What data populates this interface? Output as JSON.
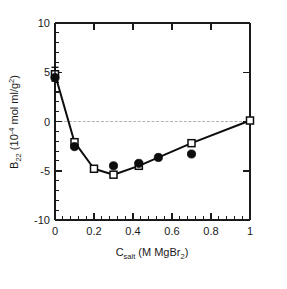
{
  "chart_data": {
    "type": "line",
    "title": "",
    "subtitle": "",
    "xlabel_parts": {
      "main_c": "C",
      "sub_salt": "salt",
      "units": " (M MgBr",
      "sub_2": "2",
      "close": ")"
    },
    "xlabel": "Csalt (M MgBr2)",
    "ylabel_parts": {
      "main_b": "B",
      "sub_22": "22",
      "open": " (10",
      "sup_minus4": "-4",
      "units": " mol ml/g",
      "sup_2": "2",
      "close": ")"
    },
    "ylabel": "B22 (10-4 mol ml/g2)",
    "xlim": [
      0,
      1
    ],
    "ylim": [
      -10,
      10
    ],
    "xticks": [
      0,
      0.2,
      0.4,
      0.6,
      0.8,
      1
    ],
    "xtick_labels": [
      "0",
      "0.2",
      "0.4",
      "0.6",
      "0.8",
      "1"
    ],
    "yticks": [
      -10,
      -5,
      0,
      5,
      10
    ],
    "ytick_labels": [
      "-10",
      "-5",
      "0",
      "5",
      "10"
    ],
    "x_minor_count": 4,
    "y_minor_count": 4,
    "grid": false,
    "zero_line": true,
    "legend_position": "none",
    "series": [
      {
        "name": "open-squares-with-line",
        "marker": "open-square",
        "connected": true,
        "points": [
          {
            "x": 0.0,
            "y": 4.8,
            "yerr": 0.7
          },
          {
            "x": 0.1,
            "y": -2.1,
            "yerr": 0
          },
          {
            "x": 0.2,
            "y": -4.8,
            "yerr": 0
          },
          {
            "x": 0.3,
            "y": -5.4,
            "yerr": 0
          },
          {
            "x": 0.43,
            "y": -4.5,
            "yerr": 0
          },
          {
            "x": 0.7,
            "y": -2.2,
            "yerr": 0
          },
          {
            "x": 1.0,
            "y": 0.1,
            "yerr": 0
          }
        ]
      },
      {
        "name": "filled-circles",
        "marker": "filled-circle",
        "connected": false,
        "points": [
          {
            "x": 0.0,
            "y": 4.45
          },
          {
            "x": 0.1,
            "y": -2.55
          },
          {
            "x": 0.3,
            "y": -4.5
          },
          {
            "x": 0.43,
            "y": -4.25
          },
          {
            "x": 0.53,
            "y": -3.65
          },
          {
            "x": 0.7,
            "y": -3.3
          }
        ]
      }
    ]
  }
}
